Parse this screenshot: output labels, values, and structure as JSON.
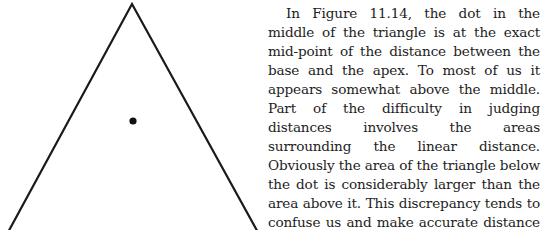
{
  "figure": {
    "label": "Figure 11.14",
    "shape": "triangle",
    "stroke_color": "#1a1a1a",
    "fill_color": "#ffffff",
    "dot_color": "#111111"
  },
  "body_text": {
    "paragraph": "In Figure 11.14, the dot in the middle of the triangle is at the exact mid-point of the distance between the base and the apex. To most of us it appears somewhat above the middle. Part of the difficulty in judging distances involves the areas surrounding the linear distance. Obviously the area of the triangle below the dot is considerably larger than the area above it. This discrepancy tends to confuse us and make accurate distance estimation difficult."
  }
}
